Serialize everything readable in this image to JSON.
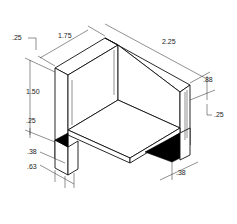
{
  "drawing": {
    "type": "isometric-technical-drawing",
    "dimensions": {
      "top_left_offset": ".25",
      "width_front": "1.75",
      "depth": "2.25",
      "height_left": "1.50",
      "height_right": ".88",
      "thickness_left": ".25",
      "thickness_right": ".25",
      "leg_inner": ".38",
      "leg_outer": ".63",
      "leg_right": ".38"
    },
    "colors": {
      "line": "#111111",
      "shade": "#000000",
      "background": "#ffffff"
    }
  }
}
